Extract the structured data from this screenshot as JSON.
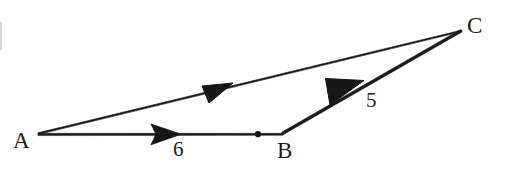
{
  "figure": {
    "kind": "vector-triangle-diagram",
    "background_color": "#ffffff",
    "stroke_color": "#1a1a1a",
    "canvas": {
      "width": 508,
      "height": 172
    }
  },
  "points": {
    "A": {
      "label": "A",
      "x": 38,
      "y": 134
    },
    "B": {
      "label": "B",
      "x": 283,
      "y": 134
    },
    "C": {
      "label": "C",
      "x": 462,
      "y": 31
    },
    "midmark": {
      "label": "",
      "x": 258,
      "y": 134
    }
  },
  "vectors": [
    {
      "name": "AB",
      "from": "A",
      "to": "B",
      "magnitude_label": "6",
      "arrow_direction": "right",
      "arrow_at": {
        "x": 162,
        "y": 133
      }
    },
    {
      "name": "AC",
      "from": "A",
      "to": "C",
      "magnitude_label": "",
      "arrow_direction": "up-right",
      "arrow_at": {
        "x": 216,
        "y": 90
      }
    },
    {
      "name": "BC",
      "from": "B",
      "to": "C",
      "magnitude_label": "5",
      "arrow_direction": "down-left",
      "arrow_at": {
        "x": 345,
        "y": 95
      }
    }
  ],
  "labels": {
    "vertex_A": "A",
    "vertex_B": "B",
    "vertex_C": "C",
    "magnitude_AB": "6",
    "magnitude_BC": "5"
  }
}
